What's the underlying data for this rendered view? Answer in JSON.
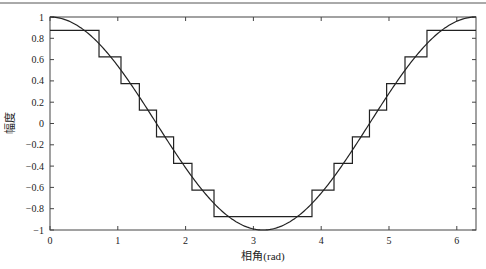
{
  "chart_data": {
    "type": "line",
    "title": "",
    "xlabel": "相角(rad)",
    "ylabel": "幅度",
    "xlim": [
      0,
      6.2832
    ],
    "ylim": [
      -1,
      1
    ],
    "xticks": [
      0,
      1,
      2,
      3,
      4,
      5,
      6
    ],
    "xtick_labels": [
      "0",
      "1",
      "2",
      "3",
      "4",
      "5",
      "6"
    ],
    "yticks": [
      1,
      0.8,
      0.6,
      0.4,
      0.2,
      0,
      -0.2,
      -0.4,
      -0.6,
      -0.8,
      -1
    ],
    "ytick_labels": [
      "1",
      "0.8",
      "0.6",
      "0.4",
      "0.2",
      "0",
      "−0.2",
      "−0.4",
      "−0.6",
      "−0.8",
      "−1"
    ],
    "grid": false,
    "legend": null,
    "series": [
      {
        "name": "cos(x)",
        "style": "smooth",
        "function": "cos(x)",
        "x_range": [
          0,
          6.2832
        ]
      },
      {
        "name": "quantized cos(x)",
        "style": "step",
        "levels": [
          0.875,
          0.625,
          0.375,
          0.125,
          -0.125,
          -0.375,
          -0.625,
          -0.875
        ],
        "thresholds": [
          0.75,
          0.5,
          0.25,
          0,
          -0.25,
          -0.5,
          -0.75
        ],
        "steps": [
          {
            "x_start": 0.0,
            "x_end": 0.723,
            "y": 0.875
          },
          {
            "x_start": 0.723,
            "x_end": 1.047,
            "y": 0.625
          },
          {
            "x_start": 1.047,
            "x_end": 1.318,
            "y": 0.375
          },
          {
            "x_start": 1.318,
            "x_end": 1.571,
            "y": 0.125
          },
          {
            "x_start": 1.571,
            "x_end": 1.823,
            "y": -0.125
          },
          {
            "x_start": 1.823,
            "x_end": 2.094,
            "y": -0.375
          },
          {
            "x_start": 2.094,
            "x_end": 2.419,
            "y": -0.625
          },
          {
            "x_start": 2.419,
            "x_end": 3.864,
            "y": -0.875
          },
          {
            "x_start": 3.864,
            "x_end": 4.189,
            "y": -0.625
          },
          {
            "x_start": 4.189,
            "x_end": 4.46,
            "y": -0.375
          },
          {
            "x_start": 4.46,
            "x_end": 4.712,
            "y": -0.125
          },
          {
            "x_start": 4.712,
            "x_end": 4.965,
            "y": 0.125
          },
          {
            "x_start": 4.965,
            "x_end": 5.236,
            "y": 0.375
          },
          {
            "x_start": 5.236,
            "x_end": 5.56,
            "y": 0.625
          },
          {
            "x_start": 5.56,
            "x_end": 6.2832,
            "y": 0.875
          }
        ]
      }
    ]
  },
  "colors": {
    "line": "#222222",
    "axis": "#333333",
    "background": "#ffffff"
  }
}
